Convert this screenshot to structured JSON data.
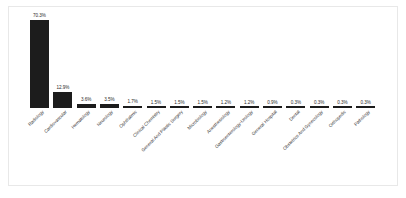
{
  "chart_data": {
    "type": "bar",
    "title": "",
    "subtitle": "",
    "xlabel": "",
    "ylabel": "",
    "ylim": [
      0,
      70.3
    ],
    "grid": false,
    "legend": "none",
    "orientation": "vertical",
    "bar_color": "#1c1c1c",
    "value_label_suffix": "%",
    "categories": [
      "Radiology",
      "Cardiovascular",
      "Hematology",
      "Neurology",
      "Ophthalmic",
      "Clinical Chemistry",
      "General And Plastic Surgery",
      "Microbiology",
      "Anesthesiology",
      "Gastroenterology-Urology",
      "General Hospital",
      "Dental",
      "Obstetrics And Gynecology",
      "Orthopedic",
      "Pathology"
    ],
    "values": [
      70.3,
      12.9,
      3.6,
      3.5,
      1.7,
      1.5,
      1.5,
      1.5,
      1.2,
      1.2,
      0.9,
      0.3,
      0.3,
      0.3,
      0.3
    ],
    "value_labels": [
      "70.3%",
      "12.9%",
      "3.6%",
      "3.5%",
      "1.7%",
      "1.5%",
      "1.5%",
      "1.5%",
      "1.2%",
      "1.2%",
      "0.9%",
      "0.3%",
      "0.3%",
      "0.3%",
      "0.3%"
    ]
  },
  "colors": {
    "bar": "#1c1c1c",
    "frame": "#e8e8e8",
    "background": "#ffffff",
    "value_text": "#2b2b2b",
    "category_text": "#3a3a3a"
  }
}
